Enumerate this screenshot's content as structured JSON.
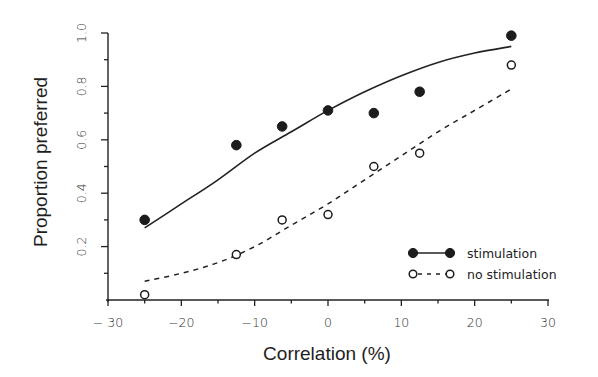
{
  "chart_data": {
    "type": "scatter",
    "title": "",
    "xlabel": "Correlation (%)",
    "ylabel": "Proportion preferred",
    "xlim": [
      -30,
      30
    ],
    "ylim": [
      0,
      1.0
    ],
    "grid": false,
    "legend_position": "lower right",
    "x_ticks": [
      -30,
      -20,
      -10,
      0,
      10,
      20,
      30
    ],
    "x_tick_labels": [
      "− 30",
      "−20",
      "−10",
      "0",
      "10",
      "20",
      "30"
    ],
    "x_minor_ticks": [
      -25,
      -15,
      -5,
      5,
      15,
      25
    ],
    "y_ticks": [
      0.2,
      0.4,
      0.6,
      0.8,
      1.0
    ],
    "y_tick_labels": [
      "0.2",
      "0.4",
      "0.6",
      "0.8",
      "1.0"
    ],
    "y_minor_ticks": [
      0.1,
      0.3,
      0.5,
      0.7,
      0.9
    ],
    "x": [
      -25,
      -12.5,
      -6.25,
      0,
      6.25,
      12.5,
      25
    ],
    "series": [
      {
        "name": "stimulation",
        "marker": "filled-circle",
        "line": "solid",
        "values": [
          0.3,
          0.58,
          0.65,
          0.71,
          0.7,
          0.78,
          0.99
        ],
        "fit_curve": {
          "x": [
            -25,
            -20,
            -15,
            -10,
            -5,
            0,
            5,
            10,
            15,
            20,
            25
          ],
          "y": [
            0.27,
            0.36,
            0.45,
            0.55,
            0.63,
            0.71,
            0.78,
            0.84,
            0.89,
            0.925,
            0.95
          ]
        }
      },
      {
        "name": "no stimulation",
        "marker": "open-circle",
        "line": "dashed",
        "values": [
          0.02,
          0.17,
          0.3,
          0.32,
          0.5,
          0.55,
          0.88
        ],
        "fit_curve": {
          "x": [
            -25,
            -20,
            -15,
            -10,
            -5,
            0,
            5,
            10,
            15,
            20,
            25
          ],
          "y": [
            0.07,
            0.1,
            0.14,
            0.2,
            0.28,
            0.36,
            0.45,
            0.54,
            0.63,
            0.71,
            0.79
          ]
        }
      }
    ]
  },
  "legend": {
    "items": [
      {
        "label": "stimulation",
        "marker": "filled-circle",
        "line": "solid"
      },
      {
        "label": "no stimulation",
        "marker": "open-circle",
        "line": "dashed"
      }
    ]
  },
  "axes": {
    "x_title": "Correlation (%)",
    "y_title": "Proportion preferred"
  }
}
